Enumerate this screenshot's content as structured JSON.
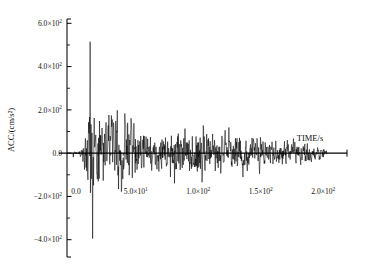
{
  "figure": {
    "background": "#ffffff",
    "line_color": "#000000",
    "font_style": "serif"
  },
  "chart_data": {
    "type": "line",
    "title": "",
    "subtitle": "",
    "xlabel": "TIME/s",
    "ylabel": "ACC/(cm/s²)",
    "xlim": [
      -5,
      215
    ],
    "ylim": [
      -480,
      620
    ],
    "grid": false,
    "legend": null,
    "legend_position": "none",
    "x_ticks": [
      0,
      50,
      100,
      150,
      200
    ],
    "x_tick_labels": [
      "0.0",
      "5.0×10¹",
      "1.0×10²",
      "1.5×10²",
      "2.0×10²"
    ],
    "x_minor_tick_count": 4,
    "y_ticks": [
      -400,
      -200,
      0,
      200,
      400,
      600
    ],
    "y_tick_labels": [
      "−4.0×10²",
      "−2.0×10²",
      "0.0",
      "2.0×10²",
      "4.0×10²",
      "6.0×10²"
    ],
    "y_minor_tick_count": 1,
    "units": {
      "x": "s",
      "y": "cm/s²"
    },
    "series": [
      {
        "name": "ground acceleration",
        "peak_positive": 515,
        "peak_positive_time": 13.5,
        "peak_negative": -395,
        "peak_negative_time": 15.5,
        "duration_s": 203,
        "sample_interval_s": 0.25,
        "description": "Strong-motion accelerogram: quiet onset to ~6 s, intense shaking 10–62 s, moderate sustained motion 62–150 s, gradual decay to ~203 s."
      }
    ],
    "envelope_control_points": [
      {
        "t": 0,
        "amp": 12
      },
      {
        "t": 4,
        "amp": 22
      },
      {
        "t": 7,
        "amp": 90
      },
      {
        "t": 10,
        "amp": 175
      },
      {
        "t": 13,
        "amp": 520
      },
      {
        "t": 16,
        "amp": 400
      },
      {
        "t": 20,
        "amp": 310
      },
      {
        "t": 26,
        "amp": 300
      },
      {
        "t": 31,
        "amp": 330
      },
      {
        "t": 36,
        "amp": 375
      },
      {
        "t": 41,
        "amp": 310
      },
      {
        "t": 47,
        "amp": 250
      },
      {
        "t": 55,
        "amp": 200
      },
      {
        "t": 63,
        "amp": 150
      },
      {
        "t": 70,
        "amp": 160
      },
      {
        "t": 78,
        "amp": 255
      },
      {
        "t": 86,
        "amp": 230
      },
      {
        "t": 94,
        "amp": 215
      },
      {
        "t": 101,
        "amp": 310
      },
      {
        "t": 108,
        "amp": 200
      },
      {
        "t": 116,
        "amp": 175
      },
      {
        "t": 124,
        "amp": 205
      },
      {
        "t": 132,
        "amp": 180
      },
      {
        "t": 140,
        "amp": 160
      },
      {
        "t": 150,
        "amp": 145
      },
      {
        "t": 160,
        "amp": 120
      },
      {
        "t": 172,
        "amp": 115
      },
      {
        "t": 184,
        "amp": 100
      },
      {
        "t": 195,
        "amp": 70
      },
      {
        "t": 203,
        "amp": 25
      }
    ]
  }
}
